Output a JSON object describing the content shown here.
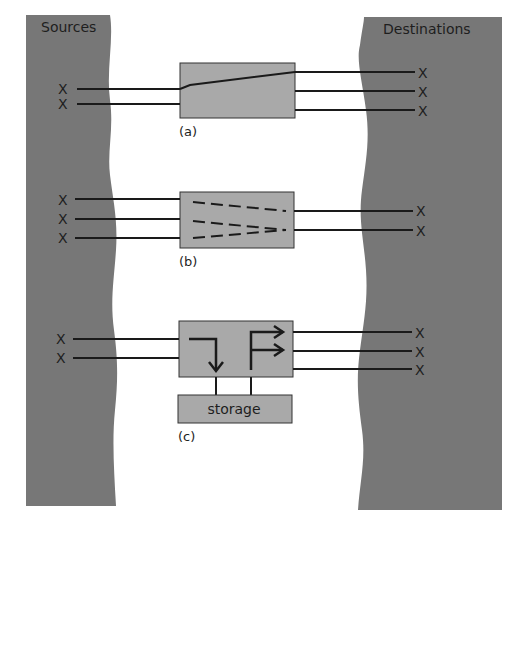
{
  "colors": {
    "band": "#777777",
    "box": "#a9a9a9",
    "line": "#1a1a1a",
    "background": "#ffffff"
  },
  "sources": {
    "title": "Sources",
    "marker": "X"
  },
  "destinations": {
    "title": "Destinations",
    "marker": "X"
  },
  "panels": [
    {
      "id": "a",
      "caption": "(a)",
      "inputs": 2,
      "outputs": 3,
      "description": "input 1 switched to output 1"
    },
    {
      "id": "b",
      "caption": "(b)",
      "inputs": 3,
      "outputs": 2,
      "description": "dashed paths converge to output 2"
    },
    {
      "id": "c",
      "caption": "(c)",
      "inputs": 2,
      "outputs": 3,
      "description": "store and forward via storage",
      "storage_label": "storage"
    }
  ]
}
